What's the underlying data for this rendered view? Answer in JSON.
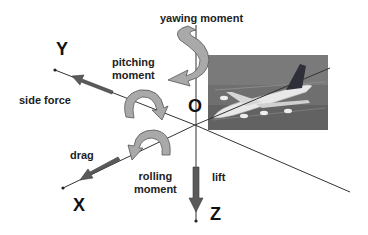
{
  "diagram": {
    "origin_label": "O",
    "axes": [
      {
        "id": "X",
        "label": "X"
      },
      {
        "id": "Y",
        "label": "Y"
      },
      {
        "id": "Z",
        "label": "Z"
      }
    ],
    "forces": [
      {
        "id": "side_force",
        "label": "side force",
        "axis": "Y"
      },
      {
        "id": "drag",
        "label": "drag",
        "axis": "X"
      },
      {
        "id": "lift",
        "label": "lift",
        "axis": "Z"
      }
    ],
    "moments": [
      {
        "id": "yawing",
        "label": "yawing moment",
        "axis": "Z"
      },
      {
        "id": "pitching",
        "label_line1": "pitching",
        "label_line2": "moment",
        "axis": "Y"
      },
      {
        "id": "rolling",
        "label_line1": "rolling",
        "label_line2": "moment",
        "axis": "X"
      }
    ],
    "image": {
      "subject": "airliner photo on runway"
    },
    "colors": {
      "arrow_fill": "#a9a9a9",
      "arrow_stroke": "#555555",
      "force_arrow": "#5a5a5a",
      "axis_line": "#333333",
      "photo_bg": "#6e6e6e"
    }
  }
}
